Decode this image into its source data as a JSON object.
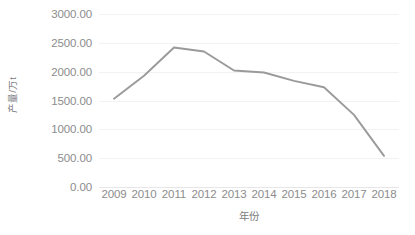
{
  "chart_data": {
    "type": "line",
    "title": "",
    "xlabel": "年份",
    "ylabel": "产量/万t",
    "categories": [
      "2009",
      "2010",
      "2011",
      "2012",
      "2013",
      "2014",
      "2015",
      "2016",
      "2017",
      "2018"
    ],
    "values": [
      1530,
      1930,
      2420,
      2350,
      2020,
      1985,
      1840,
      1730,
      1250,
      540
    ],
    "series": [
      {
        "name": "产量",
        "values": [
          1530,
          1930,
          2420,
          2350,
          2020,
          1985,
          1840,
          1730,
          1250,
          540
        ]
      }
    ],
    "ylim": [
      0,
      3000
    ],
    "ytick_labels": [
      "3000.00",
      "2500.00",
      "2000.00",
      "1500.00",
      "1000.00",
      "500.00",
      "0.00"
    ],
    "ytick_values": [
      3000,
      2500,
      2000,
      1500,
      1000,
      500,
      0
    ],
    "grid": true,
    "legend": false,
    "legend_position": "none",
    "line_color": "#9a9a9a",
    "grid_color": "#f2f2f2",
    "text_color": "#8c8c8c",
    "background_color": "#ffffff"
  }
}
